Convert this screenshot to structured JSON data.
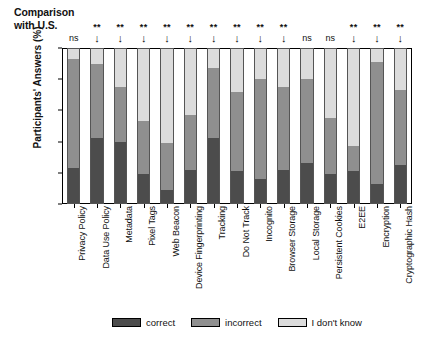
{
  "header": {
    "comparison_line1": "Comparison",
    "comparison_line2": "with U.S."
  },
  "axis": {
    "ylabel": "Participants' Answers (%)",
    "yticks": [
      "100",
      "80",
      "60",
      "40",
      "20",
      "0"
    ]
  },
  "legend": {
    "items": [
      {
        "label": "correct",
        "swatch": "correct",
        "color": "#4c4c4c"
      },
      {
        "label": "incorrect",
        "swatch": "incorrect",
        "color": "#8f8f8f"
      },
      {
        "label": "I don't know",
        "swatch": "dk",
        "color": "#dcdcdc"
      }
    ]
  },
  "significance": [
    {
      "stars": "",
      "mark": "ns"
    },
    {
      "stars": "**",
      "mark": "↓"
    },
    {
      "stars": "**",
      "mark": "↓"
    },
    {
      "stars": "**",
      "mark": "↓"
    },
    {
      "stars": "**",
      "mark": "↓"
    },
    {
      "stars": "**",
      "mark": "↓"
    },
    {
      "stars": "**",
      "mark": "↓"
    },
    {
      "stars": "**",
      "mark": "↓"
    },
    {
      "stars": "**",
      "mark": "↓"
    },
    {
      "stars": "**",
      "mark": "↓"
    },
    {
      "stars": "",
      "mark": "ns"
    },
    {
      "stars": "",
      "mark": "ns"
    },
    {
      "stars": "**",
      "mark": "↓"
    },
    {
      "stars": "**",
      "mark": "↓"
    },
    {
      "stars": "**",
      "mark": "↓"
    },
    {
      "stars": "",
      "mark": "ns"
    }
  ],
  "chart_data": {
    "type": "bar",
    "subtype": "stacked-100-percent",
    "title": "",
    "xlabel": "",
    "ylabel": "Participants' Answers (%)",
    "ylim": [
      0,
      100
    ],
    "grid": false,
    "legend_position": "bottom",
    "orientation": "vertical",
    "categories": [
      "Privacy Policy",
      "Data Use Policy",
      "Metadata",
      "Pixel Tags",
      "Web Beacon",
      "Device Fingerprinting",
      "Tracking",
      "Do Not Track",
      "Incognito",
      "Browser Storage",
      "Local Storage",
      "Persistent Cookies",
      "E2EE",
      "Encryption",
      "Cryptographic Hash"
    ],
    "series": [
      {
        "name": "correct",
        "color": "#4c4c4c",
        "values": [
          23,
          42,
          40,
          19,
          9,
          22,
          42,
          21,
          16,
          22,
          26,
          19,
          21,
          13,
          25
        ]
      },
      {
        "name": "incorrect",
        "color": "#8f8f8f",
        "values": [
          70,
          48,
          35,
          34,
          30,
          35,
          45,
          51,
          64,
          53,
          54,
          36,
          16,
          78,
          48
        ]
      },
      {
        "name": "I don't know",
        "color": "#dcdcdc",
        "values": [
          7,
          10,
          25,
          47,
          61,
          43,
          13,
          28,
          20,
          25,
          20,
          45,
          63,
          9,
          27
        ]
      }
    ],
    "annotations": {
      "comparison_with_us": [
        "ns",
        "**↓",
        "**↓",
        "**↓",
        "**↓",
        "**↓",
        "**↓",
        "**↓",
        "**↓",
        "**↓",
        "ns",
        "ns",
        "**↓",
        "**↓",
        "**↓",
        "ns"
      ]
    }
  }
}
